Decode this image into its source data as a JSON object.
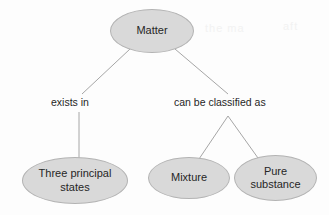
{
  "diagram": {
    "type": "concept-map",
    "background_color": "#fdfdfd",
    "node_fill_color": "#d9d9d9",
    "node_border_color": "#b3b3b3",
    "text_color": "#262626",
    "edge_color": "#a6a6a6",
    "nodes": [
      {
        "id": "matter",
        "label": "Matter",
        "lines": [
          "Matter"
        ]
      },
      {
        "id": "three",
        "label": "Three principal states",
        "lines": [
          "Three principal",
          "states"
        ]
      },
      {
        "id": "mixture",
        "label": "Mixture",
        "lines": [
          "Mixture"
        ]
      },
      {
        "id": "pure",
        "label": "Pure substance",
        "lines": [
          "Pure",
          "substance"
        ]
      }
    ],
    "edge_labels": [
      {
        "id": "exists-in",
        "text": "exists in"
      },
      {
        "id": "classified-as",
        "text": "can be classified as"
      }
    ],
    "edges": [
      {
        "from": "matter",
        "to": "exists-in"
      },
      {
        "from": "matter",
        "to": "classified-as"
      },
      {
        "from": "exists-in",
        "to": "three"
      },
      {
        "from": "classified-as",
        "to": "mixture"
      },
      {
        "from": "classified-as",
        "to": "pure"
      }
    ],
    "artifacts": [
      "the ma",
      "aft"
    ]
  }
}
